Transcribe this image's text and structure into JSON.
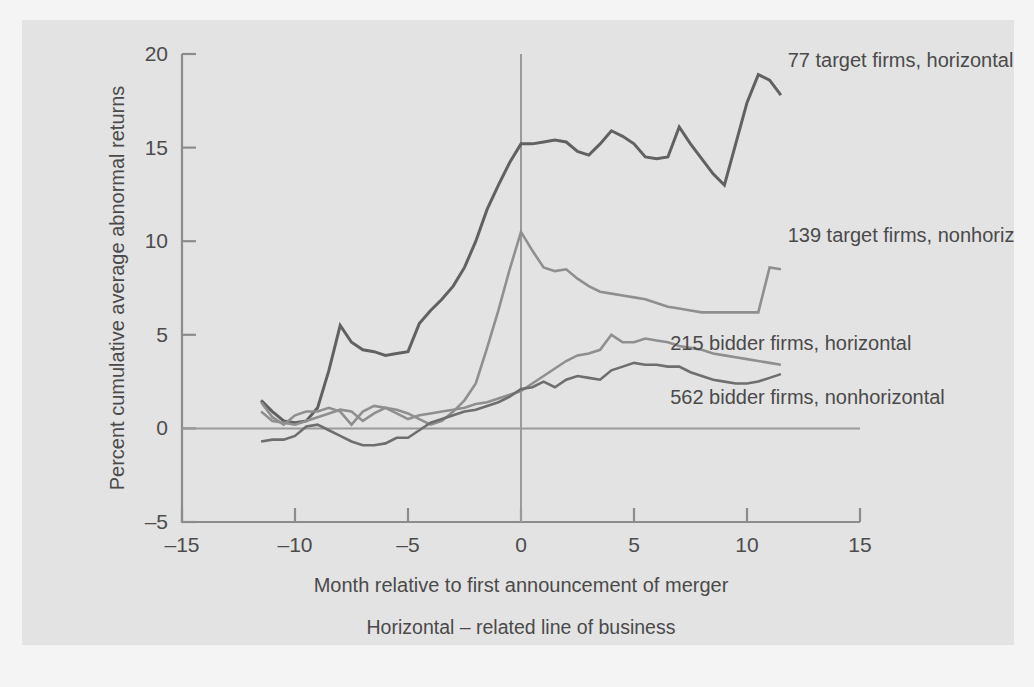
{
  "figure": {
    "background_color": "#f4f4f4",
    "panel_color": "#e3e3e3"
  },
  "chart_data": {
    "type": "line",
    "title": "",
    "subtitle": "",
    "xlabel": "Month relative to first announcement of merger",
    "ylabel": "Percent cumulative average abnormal returns",
    "xlim": [
      -15,
      15
    ],
    "ylim": [
      -5,
      20
    ],
    "xticks": [
      -15,
      -10,
      -5,
      0,
      5,
      10,
      15
    ],
    "xtick_labels": [
      "–15",
      "–10",
      "–5",
      "0",
      "5",
      "10",
      "15"
    ],
    "yticks": [
      -5,
      0,
      5,
      10,
      15,
      20
    ],
    "ytick_labels": [
      "–5",
      "0",
      "5",
      "10",
      "15",
      "20"
    ],
    "grid": false,
    "legend_position": "inline-right",
    "annotations": [
      {
        "text": "Horizontal – related line of business",
        "role": "footnote"
      },
      {
        "text": "Nonhorizontal – nonrelated line of business",
        "role": "footnote"
      }
    ],
    "reference_lines": [
      {
        "name": "zero-return-line",
        "axis": "y",
        "value": 0,
        "color": "#9a9a9a"
      },
      {
        "name": "announcement-month-line",
        "axis": "x",
        "value": 0,
        "color": "#9a9a9a"
      }
    ],
    "series": [
      {
        "name": "77 target firms, horizontal",
        "color": "#616161",
        "width": 3.0,
        "label_x": 11.8,
        "label_y": 19.6,
        "x": [
          -11.5,
          -11,
          -10.5,
          -10,
          -9.5,
          -9,
          -8.5,
          -8,
          -7.5,
          -7,
          -6.5,
          -6,
          -5.5,
          -5,
          -4.5,
          -4,
          -3.5,
          -3,
          -2.5,
          -2,
          -1.5,
          -1,
          -0.5,
          0,
          0.5,
          1,
          1.5,
          2,
          2.5,
          3,
          3.5,
          4,
          4.5,
          5,
          5.5,
          6,
          6.5,
          7,
          7.5,
          8,
          8.5,
          9,
          9.5,
          10,
          10.5,
          11,
          11.5
        ],
        "y": [
          1.5,
          0.9,
          0.4,
          0.3,
          0.4,
          1.1,
          3.1,
          5.5,
          4.6,
          4.2,
          4.1,
          3.9,
          4.0,
          4.1,
          5.6,
          6.3,
          6.9,
          7.6,
          8.6,
          10.0,
          11.7,
          13.0,
          14.2,
          15.2,
          15.2,
          15.3,
          15.4,
          15.3,
          14.8,
          14.6,
          15.2,
          15.9,
          15.6,
          15.2,
          14.5,
          14.4,
          14.5,
          16.1,
          15.2,
          14.4,
          13.6,
          13.0,
          15.2,
          17.4,
          18.9,
          18.6,
          17.8
        ]
      },
      {
        "name": "139 target firms, nonhorizontal",
        "color": "#8f8f8f",
        "width": 2.6,
        "label_x": 11.8,
        "label_y": 10.3,
        "x": [
          -11.5,
          -11,
          -10.5,
          -10,
          -9.5,
          -9,
          -8.5,
          -8,
          -7.5,
          -7,
          -6.5,
          -6,
          -5.5,
          -5,
          -4.5,
          -4,
          -3.5,
          -3,
          -2.5,
          -2,
          -1.5,
          -1,
          -0.5,
          0,
          0.5,
          1,
          1.5,
          2,
          2.5,
          3,
          3.5,
          4,
          4.5,
          5,
          5.5,
          6,
          6.5,
          7,
          7.5,
          8,
          8.5,
          9,
          9.5,
          10,
          10.5,
          11,
          11.5
        ],
        "y": [
          1.4,
          0.6,
          0.2,
          0.7,
          0.9,
          0.9,
          1.1,
          0.9,
          0.2,
          0.9,
          1.2,
          1.1,
          1.0,
          0.8,
          0.5,
          0.2,
          0.4,
          0.9,
          1.5,
          2.4,
          4.3,
          6.3,
          8.5,
          10.5,
          9.5,
          8.6,
          8.4,
          8.5,
          8.0,
          7.6,
          7.3,
          7.2,
          7.1,
          7.0,
          6.9,
          6.7,
          6.5,
          6.4,
          6.3,
          6.2,
          6.2,
          6.2,
          6.2,
          6.2,
          6.2,
          8.6,
          8.5
        ]
      },
      {
        "name": "215 bidder firms, horizontal",
        "color": "#8f8f8f",
        "width": 2.6,
        "label_x": 6.6,
        "label_y": 4.5,
        "x": [
          -11.5,
          -11,
          -10.5,
          -10,
          -9.5,
          -9,
          -8.5,
          -8,
          -7.5,
          -7,
          -6.5,
          -6,
          -5.5,
          -5,
          -4.5,
          -4,
          -3.5,
          -3,
          -2.5,
          -2,
          -1.5,
          -1,
          -0.5,
          0,
          0.5,
          1,
          1.5,
          2,
          2.5,
          3,
          3.5,
          4,
          4.5,
          5,
          5.5,
          6,
          6.5,
          7,
          7.5,
          8,
          8.5,
          9,
          9.5,
          10,
          10.5,
          11,
          11.5
        ],
        "y": [
          0.9,
          0.4,
          0.3,
          0.2,
          0.4,
          0.6,
          0.8,
          1.0,
          0.9,
          0.4,
          0.8,
          1.1,
          0.8,
          0.5,
          0.7,
          0.8,
          0.9,
          1.0,
          1.1,
          1.3,
          1.4,
          1.6,
          1.8,
          2.0,
          2.4,
          2.8,
          3.2,
          3.6,
          3.9,
          4.0,
          4.2,
          5.0,
          4.6,
          4.6,
          4.8,
          4.7,
          4.6,
          4.4,
          4.3,
          4.2,
          4.0,
          3.9,
          3.8,
          3.7,
          3.6,
          3.5,
          3.4
        ]
      },
      {
        "name": "562 bidder firms, nonhorizontal",
        "color": "#6e6e6e",
        "width": 2.6,
        "label_x": 6.6,
        "label_y": 1.6,
        "x": [
          -11.5,
          -11,
          -10.5,
          -10,
          -9.5,
          -9,
          -8.5,
          -8,
          -7.5,
          -7,
          -6.5,
          -6,
          -5.5,
          -5,
          -4.5,
          -4,
          -3.5,
          -3,
          -2.5,
          -2,
          -1.5,
          -1,
          -0.5,
          0,
          0.5,
          1,
          1.5,
          2,
          2.5,
          3,
          3.5,
          4,
          4.5,
          5,
          5.5,
          6,
          6.5,
          7,
          7.5,
          8,
          8.5,
          9,
          9.5,
          10,
          10.5,
          11,
          11.5
        ],
        "y": [
          -0.7,
          -0.6,
          -0.6,
          -0.4,
          0.1,
          0.2,
          -0.1,
          -0.4,
          -0.7,
          -0.9,
          -0.9,
          -0.8,
          -0.5,
          -0.5,
          -0.1,
          0.3,
          0.5,
          0.7,
          0.9,
          1.0,
          1.2,
          1.4,
          1.7,
          2.1,
          2.2,
          2.5,
          2.2,
          2.6,
          2.8,
          2.7,
          2.6,
          3.1,
          3.3,
          3.5,
          3.4,
          3.4,
          3.3,
          3.3,
          3.0,
          2.8,
          2.6,
          2.5,
          2.4,
          2.4,
          2.5,
          2.7,
          2.9
        ]
      }
    ]
  }
}
